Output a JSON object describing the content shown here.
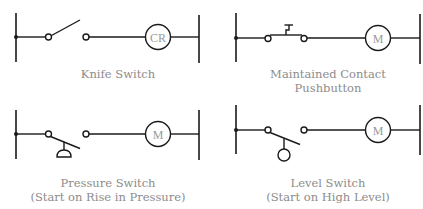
{
  "diagram": {
    "type": "ladder-logic-switch-symbols",
    "colors": {
      "line": "#1a1a1a",
      "label": "#8c8c8c",
      "coil_text": "#9a9a9a",
      "background": "#ffffff"
    },
    "panels": [
      {
        "id": "knife-switch",
        "label_line1": "Knife Switch",
        "label_line2": "",
        "coil": "CR"
      },
      {
        "id": "maintained-contact-pushbutton",
        "label_line1": "Maintained Contact",
        "label_line2": "Pushbutton",
        "coil": "M"
      },
      {
        "id": "pressure-switch",
        "label_line1": "Pressure Switch",
        "label_line2": "(Start on Rise in Pressure)",
        "coil": "M"
      },
      {
        "id": "level-switch",
        "label_line1": "Level Switch",
        "label_line2": "(Start on High Level)",
        "coil": "M"
      }
    ]
  }
}
